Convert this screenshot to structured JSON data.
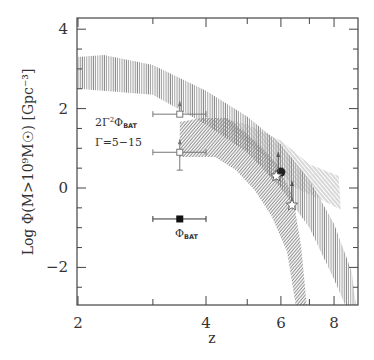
{
  "chart_data": {
    "type": "scatter",
    "title": "",
    "xlabel": "z",
    "ylabel": "Log  Φ(M>10⁹M☉)  [Gpc⁻³]",
    "xscale": "log",
    "xlim": [
      2,
      9.1
    ],
    "ylim": [
      -2.95,
      4.28
    ],
    "xticks": [
      2,
      3,
      4,
      5,
      6,
      7,
      8
    ],
    "xtick_labels": [
      "2",
      "4",
      "6",
      "8"
    ],
    "yticks": [
      -2,
      0,
      2,
      4
    ],
    "ytick_labels": [
      "−2",
      "0",
      "2",
      "4"
    ],
    "grid": false,
    "annotations": [
      {
        "text": "2Γ²Φ_BAT",
        "main": "2Γ",
        "sup": "2",
        "phi": "Φ",
        "sub": "BAT",
        "x": 2.6,
        "y": 1.75
      },
      {
        "text": "Γ=5−15",
        "x": 2.6,
        "y": 1.1
      },
      {
        "text": "Φ_BAT",
        "phi": "Φ",
        "sub": "BAT",
        "x": 3.45,
        "y": -1.25
      }
    ],
    "points": [
      {
        "name": "2Γ²Φ_BAT (Γ=15)",
        "marker": "open-square",
        "z": 3.47,
        "log_phi": 1.86,
        "z_err": [
          3.0,
          4.0
        ],
        "lower_limit": true
      },
      {
        "name": "2Γ²Φ_BAT (Γ=5)",
        "marker": "open-square",
        "z": 3.47,
        "log_phi": 0.9,
        "z_err": [
          3.0,
          4.0
        ],
        "y_err_low": 0.45,
        "lower_limit": true
      },
      {
        "name": "Φ_BAT",
        "marker": "filled-square",
        "z": 3.47,
        "log_phi": -0.78,
        "z_err": [
          3.0,
          4.0
        ]
      },
      {
        "name": "filled circle",
        "marker": "filled-circle",
        "z": 6.0,
        "log_phi": 0.4
      },
      {
        "name": "star 1",
        "marker": "open-star",
        "z": 5.85,
        "log_phi": 0.3,
        "lower_limit": true
      },
      {
        "name": "star 2",
        "marker": "open-star",
        "z": 6.37,
        "log_phi": -0.43,
        "lower_limit": true
      }
    ],
    "bands": [
      {
        "name": "vertical-hatch band",
        "hatch": "vertical",
        "upper": [
          [
            2.0,
            3.3
          ],
          [
            2.3,
            3.35
          ],
          [
            3.0,
            3.1
          ],
          [
            4.0,
            2.45
          ],
          [
            5.0,
            1.8
          ],
          [
            6.0,
            1.1
          ],
          [
            7.0,
            0.2
          ],
          [
            8.0,
            -0.9
          ],
          [
            8.8,
            -2.1
          ],
          [
            9.0,
            -2.95
          ]
        ],
        "lower": [
          [
            2.0,
            2.5
          ],
          [
            3.0,
            2.35
          ],
          [
            4.0,
            1.6
          ],
          [
            5.0,
            0.9
          ],
          [
            6.0,
            0.0
          ],
          [
            7.0,
            -1.0
          ],
          [
            8.0,
            -2.3
          ],
          [
            8.5,
            -2.95
          ]
        ]
      },
      {
        "name": "light diagonal band",
        "hatch": "diagonal-light",
        "upper": [
          [
            4.4,
            1.75
          ],
          [
            5.0,
            1.6
          ],
          [
            6.0,
            1.2
          ],
          [
            7.0,
            0.6
          ],
          [
            8.2,
            0.3
          ]
        ],
        "lower": [
          [
            4.6,
            1.45
          ],
          [
            5.5,
            0.8
          ],
          [
            6.5,
            0.0
          ],
          [
            7.5,
            -0.3
          ],
          [
            8.3,
            -0.55
          ]
        ]
      },
      {
        "name": "dense diagonal band",
        "hatch": "diagonal-dense",
        "upper": [
          [
            3.47,
            1.66
          ],
          [
            3.9,
            1.76
          ],
          [
            4.5,
            1.76
          ],
          [
            5.2,
            1.2
          ],
          [
            5.9,
            0.58
          ],
          [
            6.4,
            -0.2
          ],
          [
            6.7,
            -1.5
          ],
          [
            6.9,
            -2.95
          ]
        ],
        "lower": [
          [
            3.47,
            0.78
          ],
          [
            4.2,
            0.78
          ],
          [
            4.7,
            0.45
          ],
          [
            5.2,
            -0.05
          ],
          [
            5.7,
            -0.7
          ],
          [
            6.2,
            -1.6
          ],
          [
            6.5,
            -2.95
          ]
        ]
      }
    ]
  }
}
